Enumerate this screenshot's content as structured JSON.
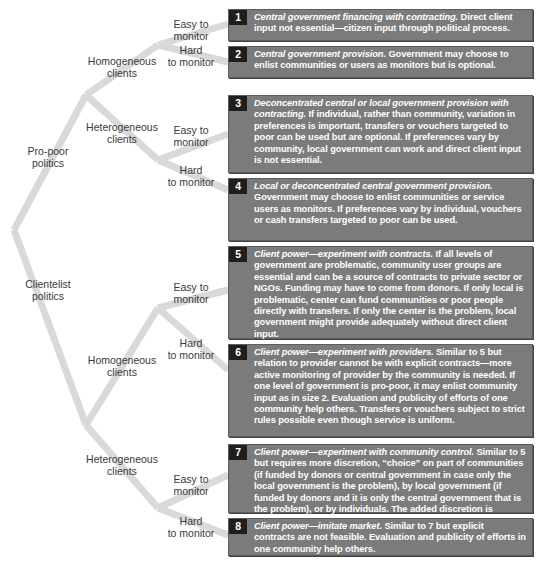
{
  "diagram": {
    "root_branches": [
      {
        "label": "Pro-poor politics",
        "line1": "Pro-poor",
        "line2": "politics",
        "client_types": [
          {
            "line1": "Homogeneous",
            "line2": "clients",
            "monitoring": [
              {
                "line1": "Easy to",
                "line2": "monitor",
                "outcome": 1
              },
              {
                "line1": "Hard",
                "line2": "to monitor",
                "outcome": 2
              }
            ]
          },
          {
            "line1": "Heterogeneous",
            "line2": "clients",
            "monitoring": [
              {
                "line1": "Easy to",
                "line2": "monitor",
                "outcome": 3
              },
              {
                "line1": "Hard",
                "line2": "to monitor",
                "outcome": 4
              }
            ]
          }
        ]
      },
      {
        "label": "Clientelist politics",
        "line1": "Clientelist",
        "line2": "politics",
        "client_types": [
          {
            "line1": "Homogeneous",
            "line2": "clients",
            "monitoring": [
              {
                "line1": "Easy to",
                "line2": "monitor",
                "outcome": 5
              },
              {
                "line1": "Hard",
                "line2": "to monitor",
                "outcome": 6
              }
            ]
          },
          {
            "line1": "Heterogeneous",
            "line2": "clients",
            "monitoring": [
              {
                "line1": "Easy to",
                "line2": "monitor",
                "outcome": 7
              },
              {
                "line1": "Hard",
                "line2": "to monitor",
                "outcome": 8
              }
            ]
          }
        ]
      }
    ],
    "outcomes": [
      {
        "number": "1",
        "title": "Central government financing with contracting.",
        "text": " Direct client input not essential—citizen input through political process."
      },
      {
        "number": "2",
        "title": "Central government provision.",
        "text": " Government may choose to enlist communities or users as monitors but is optional."
      },
      {
        "number": "3",
        "title": "Deconcentrated central or local government provision with contracting.",
        "text": " If individual, rather than community, variation in preferences is important, transfers or vouchers targeted to poor can be used but are optional. If preferences vary by community, local government can work and direct client input is not essential."
      },
      {
        "number": "4",
        "title": "Local or deconcentrated central government provision.",
        "text": " Government may choose to enlist communities or service users as monitors. If preferences vary by individual, vouchers or cash transfers targeted to poor can be used."
      },
      {
        "number": "5",
        "title": "Client power—experiment with contracts.",
        "text": " If all levels of government are problematic, community user groups are essential and can be a source of contracts to private sector or NGOs. Funding may have to come from donors. If only local is problematic, center can fund communities or poor people directly with transfers. If only the center is the problem, local government might provide adequately without direct client input."
      },
      {
        "number": "6",
        "title": "Client power—experiment with providers.",
        "text": " Similar to 5 but relation to provider cannot be with explicit contracts—more active monitoring of provider by the community is needed. If one level of government is pro-poor, it may enlist community input as in size 2. Evaluation and publicity of efforts of one community help others. Transfers or vouchers subject to  strict rules possible even though service is uniform."
      },
      {
        "number": "7",
        "title": "Client power—experiment with community control.",
        "text": " Similar to 5 but requires more discretion, “choice” on part of communities (if funded by donors or central government in case only the local government is the problem), by local government (if funded by donors and it is only the central government that is the problem), or by individuals. The added discretion is needed due to heterogeneity of preferences. Explicit contracts with providers are possible."
      },
      {
        "number": "8",
        "title": "Client power—imitate market.",
        "text": " Similar to 7 but explicit contracts are not feasible. Evaluation and publicity of efforts in one community help others."
      }
    ]
  },
  "colors": {
    "branch": "#d9d9d9",
    "box": "#7b7b7b",
    "badge": "#1e1e1e",
    "label_text": "#3a3a3a"
  }
}
